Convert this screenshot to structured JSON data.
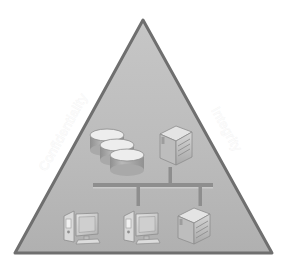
{
  "diagram": {
    "shape": "triangle",
    "background_color": "#ffffff",
    "triangle": {
      "fill_top_color": "#c4c4c4",
      "fill_bottom_color": "#b3b3b3",
      "border_color": "#6f6f6f",
      "border_width": 3,
      "apex": {
        "x": 143,
        "y": 20
      },
      "bottom_left": {
        "x": 15,
        "y": 253
      },
      "bottom_right": {
        "x": 272,
        "y": 253
      }
    },
    "edge_labels": [
      {
        "id": "confidentiality",
        "text": "Confidentiality",
        "side": "left",
        "rotation_deg": -61,
        "color": "#fbfbfb"
      },
      {
        "id": "integrity",
        "text": "Integrity",
        "side": "right",
        "rotation_deg": 61,
        "color": "#fbfbfb"
      }
    ],
    "nodes": [
      {
        "id": "database-stack",
        "label": "Database storage stack",
        "icon": "database-cylinder-icon",
        "count": 3,
        "position": {
          "x": 93,
          "y": 130
        }
      },
      {
        "id": "server-top",
        "label": "Server",
        "icon": "server-box-icon",
        "position": {
          "x": 158,
          "y": 126
        }
      },
      {
        "id": "workstation-left",
        "label": "Workstation",
        "icon": "desktop-computer-icon",
        "position": {
          "x": 62,
          "y": 206
        }
      },
      {
        "id": "workstation-middle",
        "label": "Workstation",
        "icon": "desktop-computer-icon",
        "position": {
          "x": 122,
          "y": 206
        }
      },
      {
        "id": "server-bottom",
        "label": "Server",
        "icon": "server-box-icon",
        "position": {
          "x": 176,
          "y": 208
        }
      }
    ],
    "network": {
      "bus_color": "#8e8e8e",
      "bus_line": {
        "x1": 93,
        "y1": 185,
        "x2": 213,
        "y2": 185
      },
      "drops": [
        {
          "id": "drop-up-server-top",
          "x": 170,
          "y1": 167,
          "y2": 185
        },
        {
          "id": "drop-down-workstation-middle",
          "x": 138,
          "y1": 185,
          "y2": 205
        },
        {
          "id": "drop-down-server-bottom",
          "x": 200,
          "y1": 185,
          "y2": 205
        }
      ]
    }
  }
}
